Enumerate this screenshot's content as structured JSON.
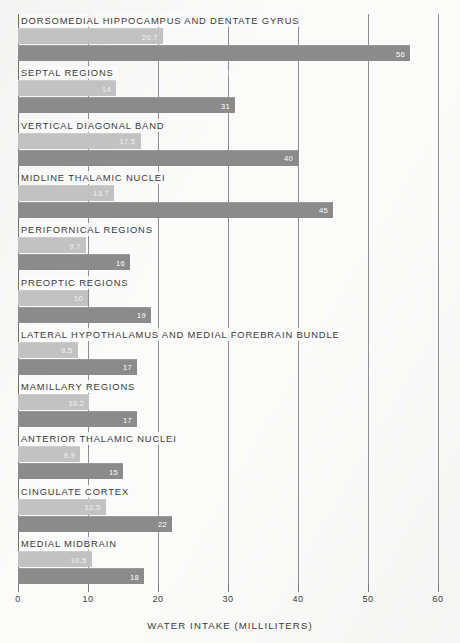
{
  "chart_data": {
    "type": "bar",
    "orientation": "horizontal",
    "title": "",
    "xlabel": "WATER INTAKE  (MILLILITERS)",
    "ylabel": "",
    "xlim": [
      0,
      60
    ],
    "xticks": [
      0,
      10,
      20,
      30,
      40,
      50,
      60
    ],
    "xticklabels": [
      "0",
      "10",
      "20",
      "30",
      "40",
      "50",
      "60"
    ],
    "grid": true,
    "legend": null,
    "categories": [
      "DORSOMEDIAL HIPPOCAMPUS AND DENTATE GYRUS",
      "SEPTAL REGIONS",
      "VERTICAL DIAGONAL BAND",
      "MIDLINE THALAMIC NUCLEI",
      "PERIFORNICAL REGIONS",
      "PREOPTIC REGIONS",
      "LATERAL HYPOTHALAMUS AND MEDIAL FOREBRAIN BUNDLE",
      "MAMILLARY REGIONS",
      "ANTERIOR THALAMIC NUCLEI",
      "CINGULATE CORTEX",
      "MEDIAL MIDBRAIN"
    ],
    "series": [
      {
        "name": "light-bar",
        "color": "#c2c2c2",
        "values": [
          20.7,
          14,
          17.5,
          13.7,
          9.7,
          10,
          8.5,
          10.2,
          8.9,
          12.5,
          10.5
        ],
        "labels": [
          "20.7",
          "14",
          "17.5",
          "13.7",
          "9.7",
          "10",
          "8.5",
          "10.2",
          "8.9",
          "12.5",
          "10.5"
        ]
      },
      {
        "name": "dark-bar",
        "color": "#8b8b8b",
        "values": [
          56,
          31,
          40,
          45,
          16,
          19,
          17,
          17,
          15,
          22,
          18
        ],
        "labels": [
          "56",
          "31",
          "40",
          "45",
          "16",
          "19",
          "17",
          "17",
          "15",
          "22",
          "18"
        ]
      }
    ]
  },
  "axis": {
    "xlabel": "WATER INTAKE  (MILLILITERS)"
  }
}
